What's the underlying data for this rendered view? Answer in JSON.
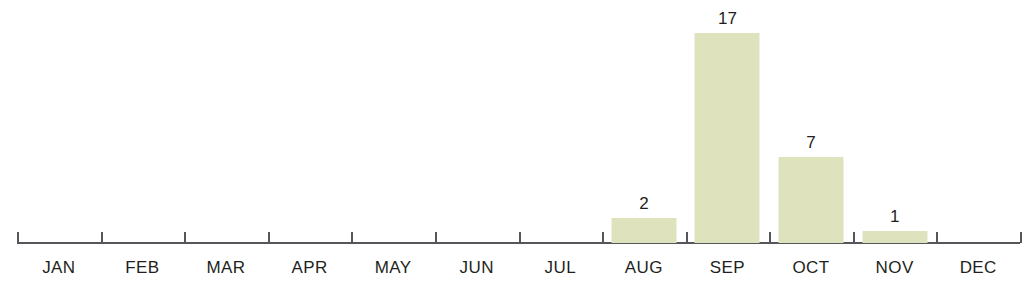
{
  "chart_data": {
    "type": "bar",
    "title": "",
    "subtitle": "",
    "xlabel": "",
    "ylabel": "",
    "categories": [
      "JAN",
      "FEB",
      "MAR",
      "APR",
      "MAY",
      "JUN",
      "JUL",
      "AUG",
      "SEP",
      "OCT",
      "NOV",
      "DEC"
    ],
    "values": [
      0,
      0,
      0,
      0,
      0,
      0,
      0,
      2,
      17,
      7,
      1,
      0
    ],
    "value_labels": [
      "",
      "",
      "",
      "",
      "",
      "",
      "",
      "2",
      "17",
      "7",
      "1",
      ""
    ],
    "ylim": [
      0,
      17
    ],
    "grid": false,
    "legend": null,
    "axis_line": true,
    "tick_marks": true,
    "bar_color": "#dee3bd",
    "axis_color": "#55565a",
    "label_color": "#231f20",
    "background_color": "#ffffff"
  }
}
